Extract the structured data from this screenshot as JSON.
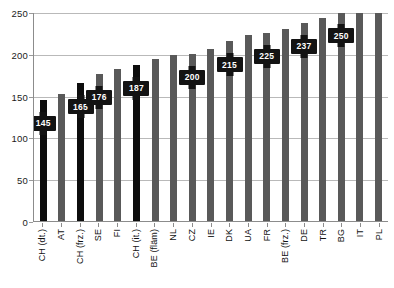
{
  "chart_data": {
    "type": "bar",
    "title": "",
    "xlabel": "",
    "ylabel": "",
    "ylim": [
      0,
      250
    ],
    "yticks": [
      0,
      50,
      100,
      150,
      200,
      250
    ],
    "ytick_labels": [
      "0",
      "50",
      "100",
      "150",
      "200",
      "250"
    ],
    "grid": true,
    "legend": null,
    "categories": [
      "CH (dt.)",
      "AT",
      "CH (frz.)",
      "SE",
      "FI",
      "CH (it.)",
      "BE (fläm)",
      "NL",
      "CZ",
      "IE",
      "DK",
      "UA",
      "FR",
      "BE (frz.)",
      "DE",
      "TR",
      "BG",
      "IT",
      "PL"
    ],
    "values": [
      145,
      152,
      165,
      176,
      182,
      187,
      194,
      198,
      200,
      206,
      215,
      222,
      225,
      230,
      237,
      243,
      250,
      256,
      256
    ],
    "data_labels": [
      "145",
      "",
      "165",
      "176",
      "",
      "187",
      "",
      "",
      "200",
      "",
      "215",
      "",
      "225",
      "",
      "237",
      "",
      "250",
      "",
      ""
    ],
    "highlighted": [
      true,
      false,
      true,
      false,
      false,
      true,
      false,
      false,
      false,
      false,
      false,
      false,
      false,
      false,
      false,
      false,
      false,
      false,
      false
    ],
    "colors": {
      "bar": "#595959",
      "bar_highlight": "#0d0d0d",
      "callout_bg": "#131313",
      "callout_text": "#ffffff",
      "grid": "#b9b9b9",
      "axis": "#8c8c8c",
      "background": "#ffffff"
    }
  }
}
